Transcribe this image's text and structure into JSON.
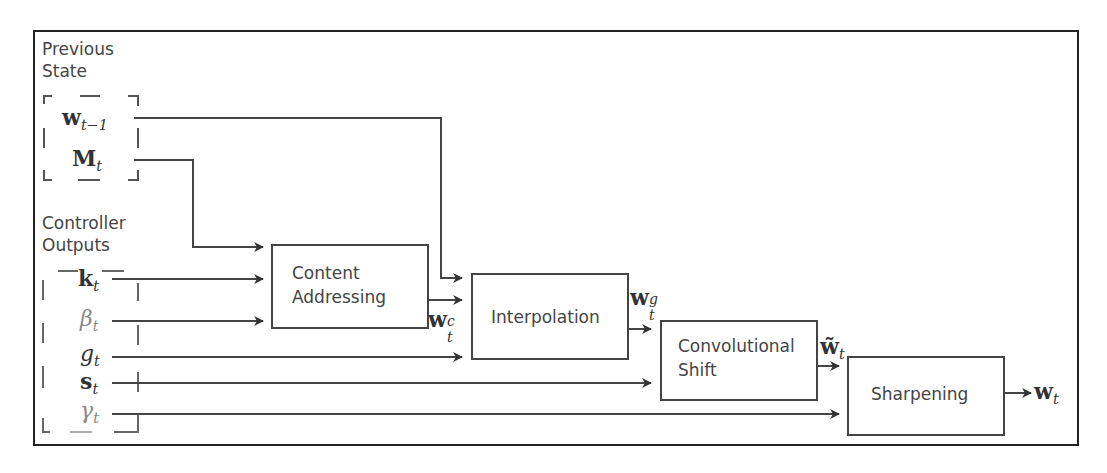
{
  "diagram": {
    "groups": {
      "previous_state": {
        "label_line1": "Previous",
        "label_line2": "State"
      },
      "controller_outputs": {
        "label_line1": "Controller",
        "label_line2": "Outputs"
      }
    },
    "inputs": {
      "w_prev": {
        "base": "w",
        "sub": "t−1"
      },
      "M": {
        "base": "M",
        "sub": "t"
      },
      "k": {
        "base": "k",
        "sub": "t"
      },
      "beta": {
        "base": "β",
        "sub": "t"
      },
      "g": {
        "base": "g",
        "sub": "t"
      },
      "s": {
        "base": "s",
        "sub": "t"
      },
      "gamma": {
        "base": "γ",
        "sub": "t"
      }
    },
    "blocks": {
      "content_addressing": {
        "line1": "Content",
        "line2": "Addressing"
      },
      "interpolation": {
        "line1": "Interpolation"
      },
      "convolutional_shift": {
        "line1": "Convolutional",
        "line2": "Shift"
      },
      "sharpening": {
        "line1": "Sharpening"
      }
    },
    "intermediates": {
      "w_c": {
        "base": "w",
        "sub": "t",
        "sup": "c"
      },
      "w_g": {
        "base": "w",
        "sub": "t",
        "sup": "g"
      },
      "w_tilde": {
        "base": "w̃",
        "sub": "t"
      },
      "w_out": {
        "base": "w",
        "sub": "t"
      }
    },
    "edges": [
      {
        "from": "w_prev",
        "to": "interpolation"
      },
      {
        "from": "M",
        "to": "content_addressing"
      },
      {
        "from": "k",
        "to": "content_addressing"
      },
      {
        "from": "beta",
        "to": "content_addressing"
      },
      {
        "from": "content_addressing",
        "to": "interpolation",
        "label": "w_c"
      },
      {
        "from": "g",
        "to": "interpolation"
      },
      {
        "from": "interpolation",
        "to": "convolutional_shift",
        "label": "w_g"
      },
      {
        "from": "s",
        "to": "convolutional_shift"
      },
      {
        "from": "convolutional_shift",
        "to": "sharpening",
        "label": "w_tilde"
      },
      {
        "from": "gamma",
        "to": "sharpening"
      },
      {
        "from": "sharpening",
        "to": "output",
        "label": "w_out"
      }
    ],
    "colors": {
      "line": "#444444",
      "frame": "#222222",
      "text": "#444444"
    }
  }
}
